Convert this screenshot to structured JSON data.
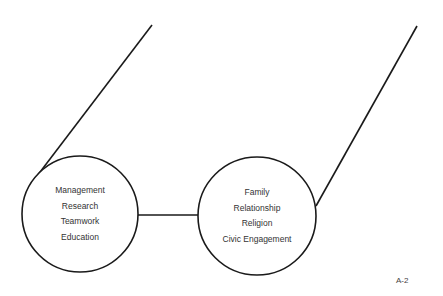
{
  "diagram": {
    "left_circle": {
      "items": [
        "Management",
        "Research",
        "Teamwork",
        "Education"
      ]
    },
    "right_circle": {
      "items": [
        "Family",
        "Relationship",
        "Religion",
        "Civic Engagement"
      ]
    },
    "page_label": "A-2"
  },
  "colors": {
    "stroke": "#1a1a1a",
    "text": "#333333",
    "background": "#ffffff"
  }
}
